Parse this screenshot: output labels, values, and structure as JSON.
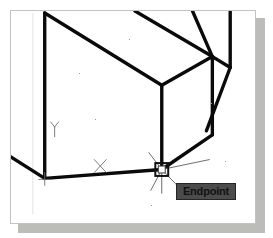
{
  "figure": {
    "kind": "cad-wireframe-drawing",
    "background_color": "#ffffff",
    "frame_border_color": "#c3c3c0",
    "shadow_color": "#b0b0ac",
    "geometry_color": "#000000",
    "cursor_color": "#555555"
  },
  "tooltip": {
    "label": "Endpoint",
    "background_color": "#4c4c4c",
    "border_color": "#252525",
    "text_color": "#111111"
  },
  "markers": {
    "endpoint_snap_marker": "square-snap-marker",
    "x_axis_marker": "x-axis-marker",
    "y_axis_marker": "y-axis-marker",
    "x_axis_label": "X",
    "y_axis_label": "Y"
  },
  "cursor": {
    "name": "crosshair-cursor",
    "x": 162,
    "y": 163
  },
  "wireframe": {
    "description": "isometric box corner wireframe",
    "edges": [
      {
        "name": "top-left-vertical-edge",
        "x1": 44,
        "y1": 12,
        "x2": 44,
        "y2": 179
      },
      {
        "name": "top-face-front-left-edge",
        "x1": 44,
        "y1": 12,
        "x2": 162,
        "y2": 85
      },
      {
        "name": "top-face-back-right-edge",
        "x1": 135,
        "y1": 8,
        "x2": 213,
        "y2": 56
      },
      {
        "name": "top-face-right-edge",
        "x1": 162,
        "y1": 85,
        "x2": 213,
        "y2": 56
      },
      {
        "name": "front-right-vertical-edge",
        "x1": 162,
        "y1": 85,
        "x2": 162,
        "y2": 170
      },
      {
        "name": "center-vertical-edge",
        "x1": 213,
        "y1": 56,
        "x2": 213,
        "y2": 135
      },
      {
        "name": "upper-diagonal-edge",
        "x1": 213,
        "y1": 56,
        "x2": 193,
        "y2": 8
      },
      {
        "name": "far-right-vertical-edge",
        "x1": 231,
        "y1": 8,
        "x2": 231,
        "y2": 67
      },
      {
        "name": "right-slanted-edge",
        "x1": 231,
        "y1": 67,
        "x2": 213,
        "y2": 56
      },
      {
        "name": "right-lower-slant-edge",
        "x1": 231,
        "y1": 67,
        "x2": 207,
        "y2": 131
      },
      {
        "name": "bottom-right-slope-edge",
        "x1": 213,
        "y1": 135,
        "x2": 162,
        "y2": 170
      },
      {
        "name": "bottom-front-edge",
        "x1": 162,
        "y1": 170,
        "x2": 44,
        "y2": 179
      },
      {
        "name": "bottom-left-slope-edge",
        "x1": 44,
        "y1": 179,
        "x2": 8,
        "y2": 156
      }
    ]
  }
}
